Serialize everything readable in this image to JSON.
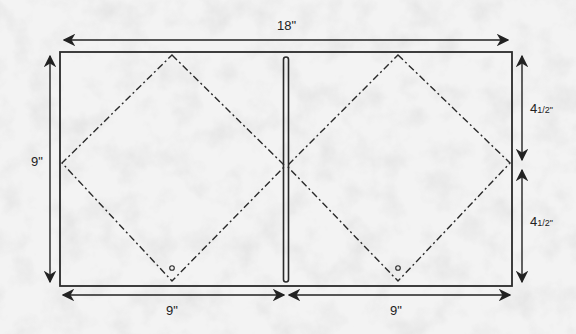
{
  "diagram": {
    "type": "pattern-template",
    "colors": {
      "background": "#f1f1f1",
      "line": "#2a2a2a",
      "texture": "#d0d0d0"
    },
    "outline": {
      "width_in": 18,
      "height_in": 9
    },
    "dimensions": {
      "total_width": "18\"",
      "left_height": "9\"",
      "bottom_left_width": "9\"",
      "bottom_right_width": "9\"",
      "right_upper_height": "4½\"",
      "right_lower_height": "4½\""
    },
    "labels": {
      "top": "18\"",
      "left": "9\"",
      "bottom_left": "9\"",
      "bottom_right": "9\"",
      "right_upper_whole": "4",
      "right_upper_frac": "1/2\"",
      "right_lower_whole": "4",
      "right_lower_frac": "1/2\""
    },
    "elements": [
      {
        "name": "outer-rectangle",
        "style": "solid"
      },
      {
        "name": "center-slot",
        "style": "rounded-slot"
      },
      {
        "name": "left-diamond",
        "style": "dash-dot"
      },
      {
        "name": "right-diamond",
        "style": "dash-dot"
      },
      {
        "name": "left-pivot-circle",
        "style": "small-circle"
      },
      {
        "name": "right-pivot-circle",
        "style": "small-circle"
      }
    ]
  }
}
